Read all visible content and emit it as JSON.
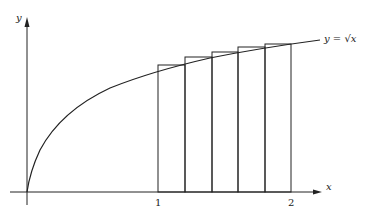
{
  "diagram": {
    "type": "riemann-sum-upper",
    "axes": {
      "x_label": "x",
      "y_label": "y"
    },
    "ticks": [
      {
        "label": "1",
        "value": 1
      },
      {
        "label": "2",
        "value": 2
      }
    ],
    "curve_label": "y = √x",
    "function": "sqrt(x)",
    "interval": [
      1,
      2
    ],
    "subintervals": 5,
    "rectangle_edges": [
      1,
      1.2,
      1.4,
      1.6,
      1.8,
      2
    ],
    "rectangle_heights": [
      "√1.2",
      "√1.4",
      "√1.6",
      "√1.8",
      "√2"
    ]
  }
}
